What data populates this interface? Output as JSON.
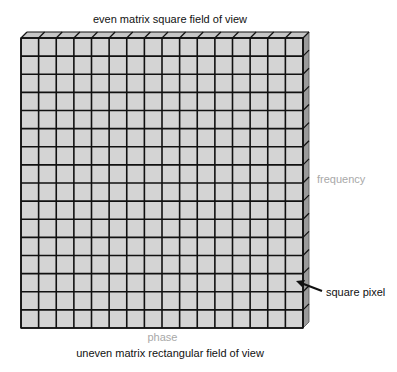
{
  "diagram": {
    "title": "even matrix square field of view",
    "subtitle": "uneven matrix rectangular field of view",
    "axis_labels": {
      "vertical": "frequency",
      "horizontal": "phase"
    },
    "callout": {
      "label": "square pixel",
      "arrow": "arrow-pointing-left"
    },
    "grid": {
      "columns": 16,
      "rows": 16,
      "cell_shape": "square"
    },
    "colors": {
      "cell_fill": "#d4d4d4",
      "top_face": "#c6c6c6",
      "side_face": "#9a9a9a",
      "grid_line": "#111111",
      "axis_label": "#a8a8a8",
      "text": "#111111"
    }
  }
}
